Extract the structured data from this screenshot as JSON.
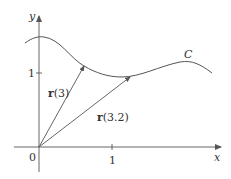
{
  "figure": {
    "axes": {
      "x_label": "x",
      "y_label": "y",
      "origin_label": "0",
      "x_tick_label": "1",
      "y_tick_label": "1"
    },
    "curve": {
      "label": "C"
    },
    "vectors": [
      {
        "bold": "r",
        "arg": "(3)"
      },
      {
        "bold": "r",
        "arg": "(3.2)"
      }
    ],
    "colors": {
      "stroke": "#555555",
      "text": "#333333",
      "background": "#ffffff"
    }
  }
}
